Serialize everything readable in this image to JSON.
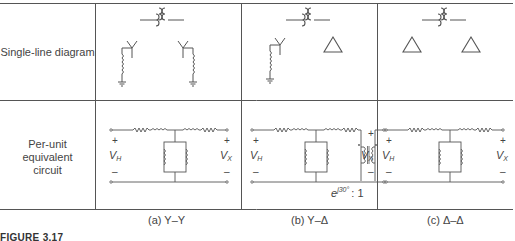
{
  "rows": {
    "single_line": "Single-line diagram",
    "per_unit": [
      "Per-unit",
      "equivalent",
      "circuit"
    ]
  },
  "columns": [
    {
      "caption": "(a)  Y–Y",
      "primary": "wye-grounded",
      "secondary": "wye-grounded"
    },
    {
      "caption": "(b)  Y–Δ",
      "primary": "wye-grounded",
      "secondary": "delta",
      "phase_shift": "e^{j30°} : 1"
    },
    {
      "caption": "(c)  Δ–Δ",
      "primary": "delta",
      "secondary": "delta"
    }
  ],
  "circuit_labels": {
    "v_h": "V",
    "v_h_sub": "H",
    "v_x": "V",
    "v_x_sub": "X",
    "plus": "+",
    "minus": "–",
    "phase_base": "e",
    "phase_exp": "j30°",
    "phase_ratio": ": 1"
  },
  "figure_label": "FIGURE 3.17",
  "colors": {
    "line": "#555555",
    "text": "#444444"
  }
}
